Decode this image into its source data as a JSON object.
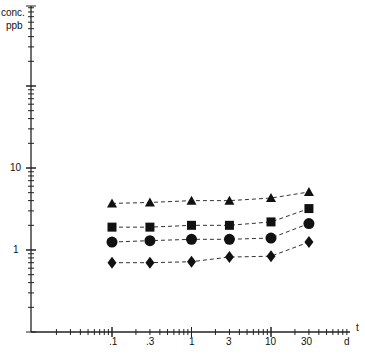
{
  "chart_data": {
    "type": "line",
    "title": "",
    "ylabel": "conc. ppb",
    "xlabel": "t d",
    "y_scale": "log",
    "x_scale": "log",
    "ylim": [
      0.1,
      1000
    ],
    "x": [
      0.1,
      0.3,
      1,
      3,
      10,
      30
    ],
    "x_tick_labels": [
      ".1",
      ".3",
      "1",
      "3",
      "10",
      "30"
    ],
    "y_tick_labels": [
      "1",
      "10"
    ],
    "grid": false,
    "legend": "none",
    "series": [
      {
        "name": "triangle",
        "marker": "triangle",
        "values": [
          3.7,
          3.8,
          4.0,
          4.0,
          4.3,
          5.1
        ]
      },
      {
        "name": "square",
        "marker": "square",
        "values": [
          1.9,
          1.9,
          2.0,
          2.0,
          2.2,
          3.2
        ]
      },
      {
        "name": "circle",
        "marker": "circle",
        "values": [
          1.25,
          1.3,
          1.35,
          1.35,
          1.4,
          2.1
        ]
      },
      {
        "name": "diamond",
        "marker": "diamond",
        "values": [
          0.7,
          0.7,
          0.72,
          0.82,
          0.84,
          1.25
        ]
      }
    ]
  },
  "labels": {
    "y_title_1": "conc.",
    "y_title_2": "ppb",
    "x_title_t": "t",
    "x_title_d": "d",
    "y10": "10",
    "y1": "1",
    "x_ticks": [
      ".1",
      ".3",
      "1",
      "3",
      "10",
      "30"
    ]
  }
}
